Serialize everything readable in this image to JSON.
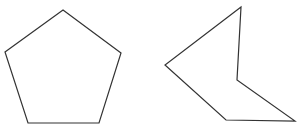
{
  "canvas": {
    "width": 299,
    "height": 132,
    "background": "#ffffff"
  },
  "style": {
    "stroke": "#333333",
    "fill": "none"
  },
  "shapes": [
    {
      "name": "regular-pentagon",
      "type": "convex polygon",
      "sides": 5,
      "points": "63,10 121,53 99,123 28,123 5,52"
    },
    {
      "name": "concave-pentagon",
      "type": "concave polygon",
      "sides": 5,
      "points": "241,7 165,65 226,120 295,121 237,80"
    }
  ]
}
